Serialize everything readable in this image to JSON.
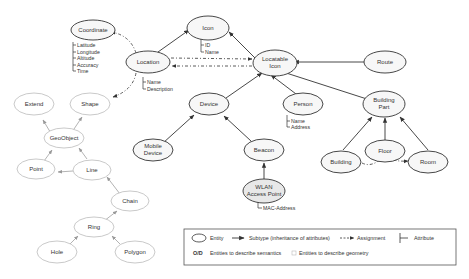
{
  "diagram": {
    "entities": {
      "coordinate": {
        "label": "Coordinate",
        "attributes": [
          "Latitude",
          "Longitude",
          "Altitude",
          "Accuracy",
          "Time"
        ]
      },
      "location": {
        "label": "Location",
        "attributes": [
          "Name",
          "Description"
        ]
      },
      "icon": {
        "label": "Icon",
        "attributes": [
          "ID",
          "Name"
        ]
      },
      "locatable_icon": {
        "label1": "Locatable",
        "label2": "Icon"
      },
      "route": {
        "label": "Route"
      },
      "device": {
        "label": "Device"
      },
      "person": {
        "label": "Person",
        "attributes": [
          "Name",
          "Address"
        ]
      },
      "building_part": {
        "label1": "Building",
        "label2": "Part"
      },
      "mobile_device": {
        "label1": "Mobile",
        "label2": "Device"
      },
      "beacon": {
        "label": "Beacon"
      },
      "wlan_ap": {
        "label1": "WLAN",
        "label2": "Access Point",
        "attributes": [
          "MAC-Address"
        ]
      },
      "building": {
        "label": "Building"
      },
      "floor": {
        "label": "Floor"
      },
      "room": {
        "label": "Room"
      },
      "extend": {
        "label": "Extend"
      },
      "shape": {
        "label": "Shape"
      },
      "geoobject": {
        "label": "GeoObject"
      },
      "point": {
        "label": "Point"
      },
      "line": {
        "label": "Line"
      },
      "chain": {
        "label": "Chain"
      },
      "ring": {
        "label": "Ring"
      },
      "hole": {
        "label": "Hole"
      },
      "polygon": {
        "label": "Polygon"
      }
    },
    "legend": {
      "entity": "Entity",
      "subtype": "Subtype (inheritance of attributes)",
      "assignment": "Assignment",
      "attribute": "Attribute",
      "semantics": "Entities to describe semantics",
      "geometry": "Entities to describe geometry",
      "semantics_symbol": "O/D"
    },
    "colors": {
      "semantic_stroke": "#333333",
      "semantic_fill": "#f4f4f4",
      "geometry_stroke": "#bbbbbb",
      "geometry_arrow": "#999999"
    }
  }
}
